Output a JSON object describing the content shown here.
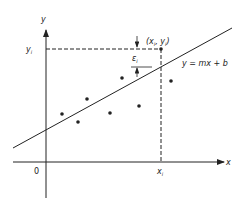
{
  "diagram": {
    "axes": {
      "x_label": "x",
      "y_label": "y",
      "origin_label": "0",
      "xi_label": "x",
      "xi_sub": "i",
      "yi_label": "y",
      "yi_sub": "i"
    },
    "line_label": "y = mx + b",
    "point_label": "(x",
    "point_label_sub1": "i",
    "point_label_mid": ", y",
    "point_label_sub2": "i",
    "point_label_end": ")",
    "residual_label": "ε",
    "residual_sub": "i",
    "data_points": [
      {
        "x": 62,
        "y": 114
      },
      {
        "x": 78,
        "y": 122
      },
      {
        "x": 87,
        "y": 99
      },
      {
        "x": 110,
        "y": 113
      },
      {
        "x": 122,
        "y": 78
      },
      {
        "x": 139,
        "y": 106
      },
      {
        "x": 171,
        "y": 81
      },
      {
        "x": 161,
        "y": 49
      }
    ],
    "colors": {
      "ink": "#222222",
      "background": "#ffffff"
    }
  }
}
